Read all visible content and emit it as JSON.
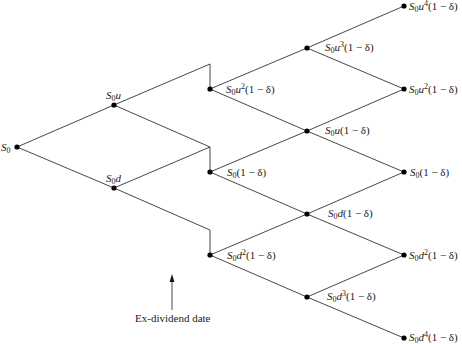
{
  "diagram": {
    "type": "binomial-tree",
    "colors": {
      "line": "#333333",
      "node": "#000000",
      "text": "#1a1a1a"
    },
    "nodes": [
      {
        "id": "n0",
        "label_base": "S",
        "label_sub": "0",
        "label_rest": "",
        "label_tail": ""
      },
      {
        "id": "n1u",
        "label_base": "S",
        "label_sub": "0",
        "label_rest": "u",
        "label_tail": ""
      },
      {
        "id": "n1d",
        "label_base": "S",
        "label_sub": "0",
        "label_rest": "d",
        "label_tail": ""
      },
      {
        "id": "n2uu",
        "label_base": "S",
        "label_sub": "0",
        "label_rest": "u",
        "label_sup": "2",
        "label_tail": "(1 − δ)"
      },
      {
        "id": "n2ud",
        "label_base": "S",
        "label_sub": "0",
        "label_rest": "",
        "label_sup": "",
        "label_tail": "(1 − δ)"
      },
      {
        "id": "n2dd",
        "label_base": "S",
        "label_sub": "0",
        "label_rest": "d",
        "label_sup": "2",
        "label_tail": "(1 − δ)"
      },
      {
        "id": "n3u3",
        "label_base": "S",
        "label_sub": "0",
        "label_rest": "u",
        "label_sup": "3",
        "label_tail": "(1 − δ)"
      },
      {
        "id": "n3u",
        "label_base": "S",
        "label_sub": "0",
        "label_rest": "u",
        "label_sup": "",
        "label_tail": "(1 − δ)"
      },
      {
        "id": "n3d",
        "label_base": "S",
        "label_sub": "0",
        "label_rest": "d",
        "label_sup": "",
        "label_tail": "(1 − δ)"
      },
      {
        "id": "n3d3",
        "label_base": "S",
        "label_sub": "0",
        "label_rest": "d",
        "label_sup": "3",
        "label_tail": "(1 − δ)"
      },
      {
        "id": "n4u4",
        "label_base": "S",
        "label_sub": "0",
        "label_rest": "u",
        "label_sup": "4",
        "label_tail": "(1 − δ)"
      },
      {
        "id": "n4u2",
        "label_base": "S",
        "label_sub": "0",
        "label_rest": "u",
        "label_sup": "2",
        "label_tail": "(1 − δ)"
      },
      {
        "id": "n4m",
        "label_base": "S",
        "label_sub": "0",
        "label_rest": "",
        "label_sup": "",
        "label_tail": "(1 − δ)"
      },
      {
        "id": "n4d2",
        "label_base": "S",
        "label_sub": "0",
        "label_rest": "d",
        "label_sup": "2",
        "label_tail": "(1 − δ)"
      },
      {
        "id": "n4d4",
        "label_base": "S",
        "label_sub": "0",
        "label_rest": "d",
        "label_sup": "4",
        "label_tail": "(1 − δ)"
      }
    ],
    "annotation": {
      "text": "Ex-dividend date",
      "arrow_direction": "up"
    }
  }
}
